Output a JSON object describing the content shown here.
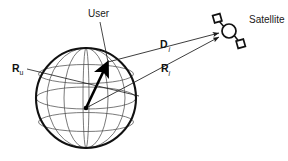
{
  "figure": {
    "type": "diagram",
    "background_color": "#ffffff",
    "ink_color": "#1a1a1a",
    "grid_color": "#555555",
    "labels": {
      "user": "User",
      "satellite": "Satellite",
      "range_user_base": "R",
      "range_user_sub": "u",
      "distance_base": "D",
      "distance_sub": "i",
      "range_sat_base": "R",
      "range_sat_sub": "i"
    },
    "elements": {
      "earth_sphere": "earth-sphere",
      "user_vector": "user-position-vector",
      "satellite_icon": "satellite-icon",
      "line_user_to_satellite": "vector-D-i",
      "line_center_to_satellite": "vector-R-i",
      "leader_user": "user-leader-line",
      "leader_ru": "ru-leader-line"
    },
    "geometry": {
      "sphere_center_x": 86,
      "sphere_center_y": 98,
      "sphere_radius": 50,
      "user_point_x": 107,
      "user_point_y": 63,
      "satellite_x": 229,
      "satellite_y": 31
    }
  }
}
